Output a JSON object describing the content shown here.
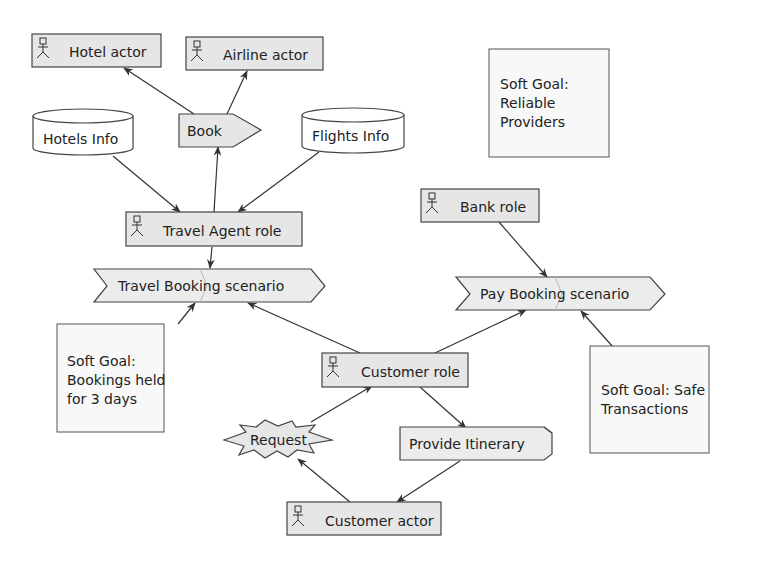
{
  "colors": {
    "fill": "#e6e6e6",
    "stroke": "#444444",
    "background": "#ffffff"
  },
  "actors": {
    "hotel_actor": "Hotel actor",
    "airline_actor": "Airline actor",
    "travel_agent_role": "Travel Agent role",
    "bank_role": "Bank role",
    "customer_role": "Customer role",
    "customer_actor": "Customer actor"
  },
  "data_stores": {
    "hotels_info": "Hotels Info",
    "flights_info": "Flights Info"
  },
  "actions": {
    "book": "Book",
    "provide_itinerary": "Provide Itinerary"
  },
  "events": {
    "request": "Request"
  },
  "scenarios": {
    "travel_booking": "Travel Booking scenario",
    "pay_booking": "Pay Booking scenario"
  },
  "soft_goals": {
    "reliable_providers": [
      "Soft Goal:",
      "Reliable",
      "Providers"
    ],
    "bookings_held": [
      "Soft Goal:",
      "Bookings held",
      "for 3 days"
    ],
    "safe_transactions": [
      "Soft Goal: Safe",
      "Transactions"
    ]
  }
}
